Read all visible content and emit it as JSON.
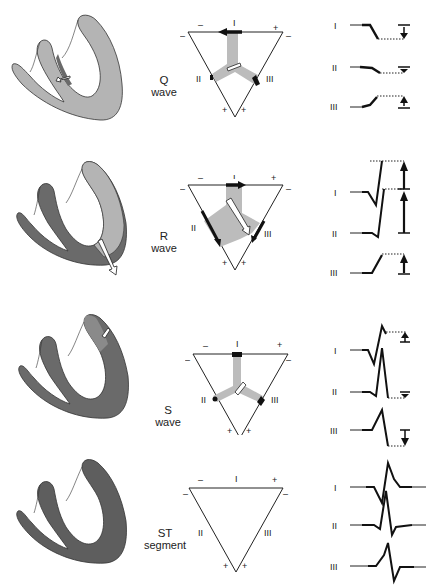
{
  "figure": {
    "colors": {
      "resting_myocardium": "#b4b4b4",
      "depolarized_myocardium": "#6a6a6a",
      "vector_shading": "#bcbcbc",
      "ink": "#111111"
    },
    "lead_labels": [
      "I",
      "II",
      "III"
    ],
    "polarity": {
      "neg": "–",
      "pos": "+"
    },
    "rows": [
      {
        "id": "q-wave",
        "caption_line1": "Q",
        "caption_line2": "wave",
        "triangle_labels": {
          "top": "I",
          "left": "II",
          "right": "III"
        },
        "leads": [
          {
            "label": "I",
            "deflection": "down"
          },
          {
            "label": "II",
            "deflection": "small down"
          },
          {
            "label": "III",
            "deflection": "up"
          }
        ]
      },
      {
        "id": "r-wave",
        "caption_line1": "R",
        "caption_line2": "wave",
        "triangle_labels": {
          "top": "I",
          "left": "II",
          "right": "III"
        },
        "leads": [
          {
            "label": "I",
            "deflection": "up"
          },
          {
            "label": "II",
            "deflection": "large up"
          },
          {
            "label": "III",
            "deflection": "up"
          }
        ]
      },
      {
        "id": "s-wave",
        "caption_line1": "S",
        "caption_line2": "wave",
        "triangle_labels": {
          "top": "I",
          "left": "II",
          "right": "III"
        },
        "leads": [
          {
            "label": "I",
            "deflection": "small up"
          },
          {
            "label": "II",
            "deflection": "small down"
          },
          {
            "label": "III",
            "deflection": "down"
          }
        ]
      },
      {
        "id": "st-segment",
        "caption_line1": "ST",
        "caption_line2": "segment",
        "triangle_labels": {
          "top": "I",
          "left": "II",
          "right": "III"
        },
        "leads": [
          {
            "label": "I",
            "deflection": "isoelectric"
          },
          {
            "label": "II",
            "deflection": "isoelectric"
          },
          {
            "label": "III",
            "deflection": "isoelectric"
          }
        ]
      }
    ]
  }
}
